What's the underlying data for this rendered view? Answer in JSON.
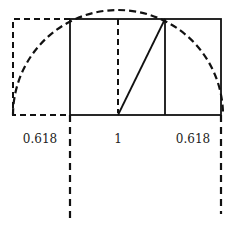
{
  "diagram": {
    "labels": {
      "left": "0.618",
      "center": "1",
      "right": "0.618"
    },
    "colors": {
      "stroke": "#111111",
      "text": "#222222",
      "background": "#ffffff"
    }
  }
}
